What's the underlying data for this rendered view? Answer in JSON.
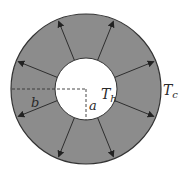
{
  "diagram": {
    "colors": {
      "annulus_fill": "#8c8c8c",
      "outline": "#333333",
      "inner_fill": "#ffffff",
      "arrow": "#222222",
      "dashed": "#333333"
    },
    "geometry": {
      "center": [
        86,
        89
      ],
      "outer_radius": 75,
      "inner_radius": 31
    },
    "arrows": {
      "count": 8,
      "angles_deg": [
        -112,
        -68,
        -22,
        22,
        68,
        112,
        158,
        -158
      ]
    },
    "labels": {
      "inner_temperature": "T",
      "inner_temperature_sub": "h",
      "outer_temperature": "T",
      "outer_temperature_sub": "c",
      "outer_radius": "b",
      "inner_radius": "a"
    }
  }
}
